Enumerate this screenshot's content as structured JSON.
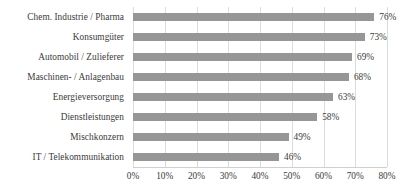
{
  "chart_data": {
    "type": "bar",
    "orientation": "horizontal",
    "title": "",
    "subtitle": "",
    "xlabel": "",
    "ylabel": "",
    "xlim": [
      0,
      80
    ],
    "grid": "vertical",
    "legend": "none",
    "bar_color": "#969696",
    "gridline_color": "#dcdcdc",
    "background_color": "#ffffff",
    "text_color": "#3a3a3a",
    "value_suffix": "%",
    "categories": [
      "Chem. Industrie / Pharma",
      "Konsumgüter",
      "Automobil / Zulieferer",
      "Maschinen- / Anlagenbau",
      "Energieversorgung",
      "Dienstleistungen",
      "Mischkonzern",
      "IT / Telekommunikation"
    ],
    "values": [
      76,
      73,
      69,
      68,
      63,
      58,
      49,
      46
    ],
    "data_labels": [
      "76%",
      "73%",
      "69%",
      "68%",
      "63%",
      "58%",
      "49%",
      "46%"
    ],
    "x_ticks": [
      0,
      10,
      20,
      30,
      40,
      50,
      60,
      70,
      80
    ],
    "x_tick_labels": [
      "0%",
      "10%",
      "20%",
      "30%",
      "40%",
      "50%",
      "60%",
      "70%",
      "80%"
    ]
  }
}
